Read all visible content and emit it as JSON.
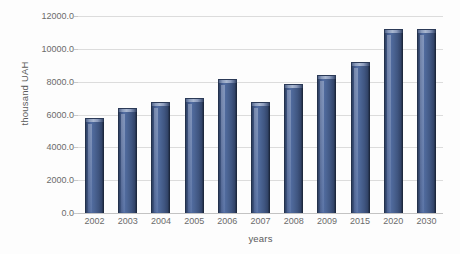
{
  "chart_data": {
    "type": "bar",
    "title": "",
    "subtitle": "",
    "xlabel": "years",
    "ylabel": "thousand UAH",
    "categories": [
      "2002",
      "2003",
      "2004",
      "2005",
      "2006",
      "2007",
      "2008",
      "2009",
      "2015",
      "2020",
      "2030"
    ],
    "values": [
      5600,
      6200,
      6550,
      6800,
      8000,
      6600,
      7650,
      8200,
      9000,
      11000,
      11000
    ],
    "series": [
      {
        "name": "thousand UAH",
        "values": [
          5600,
          6200,
          6550,
          6800,
          8000,
          6600,
          7650,
          8200,
          9000,
          11000,
          11000
        ]
      }
    ],
    "ylim": [
      0,
      12000
    ],
    "ytick_labels": [
      "12000.0",
      "10000.0",
      "8000.0",
      "6000.0",
      "4000.0",
      "2000.0",
      "0.0"
    ],
    "ytick_values": [
      12000,
      10000,
      8000,
      6000,
      4000,
      2000,
      0
    ],
    "ystep": 2000,
    "grid": "horizontal",
    "legend": "none",
    "annotations": [],
    "colors": {
      "bar_fill": "#4a6392",
      "bar_edge": "#23314c",
      "bar_highlight": "#a9b7d0",
      "gridline": "#dcdcdc",
      "axis_line": "#c3c3c3",
      "tick_text": "#6b6b6b",
      "axis_title_text": "#5a5a5a",
      "background": "#fdfdfd"
    }
  }
}
